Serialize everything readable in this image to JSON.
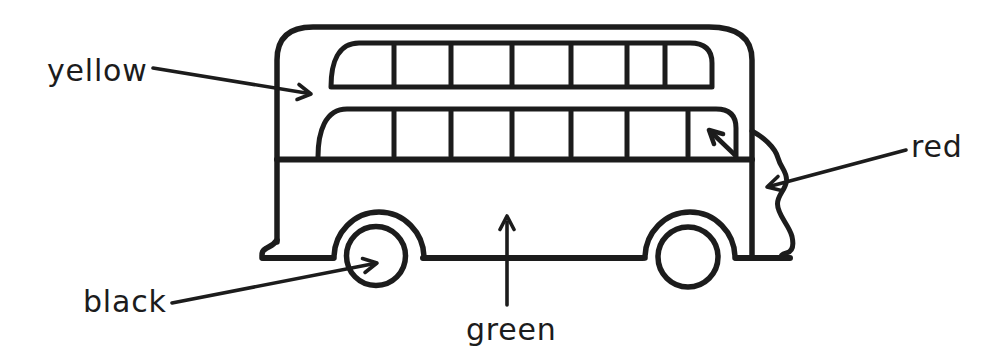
{
  "page": {
    "background_color": "#ffffff",
    "ink_color": "#1c1c1c"
  },
  "diagram": {
    "labels": {
      "yellow": "yellow",
      "red": "red",
      "black": "black",
      "green": "green"
    },
    "arrow_targets": {
      "yellow": "upper bus body beside front window",
      "red": "front panel of the bus (wavy edge)",
      "black": "front wheel",
      "green": "lower body panel"
    }
  }
}
